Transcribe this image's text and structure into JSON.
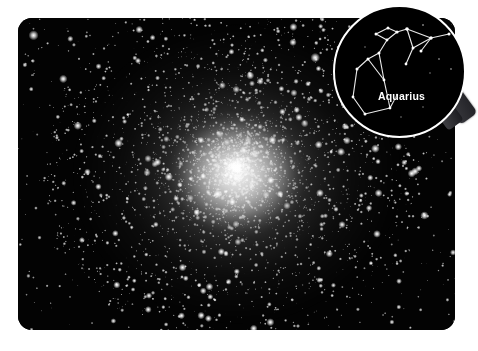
{
  "page": {
    "background_color": "#ffffff"
  },
  "photo": {
    "name": "globular-cluster-photograph",
    "background_color": "#030303",
    "subject": "globular star cluster",
    "core": {
      "center_x_pct": 50,
      "center_y_pct": 48,
      "color": "#ffffff"
    }
  },
  "magnifier": {
    "rim_color": "#ffffff",
    "lens_background": "#000000",
    "handle_color": "#35353a",
    "constellation": {
      "label": "Aquarius",
      "line_color": "#e8e8e8",
      "star_color": "#ffffff"
    }
  }
}
